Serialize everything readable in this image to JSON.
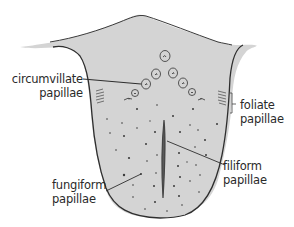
{
  "diagram": {
    "colors": {
      "tongue_fill": "#d4d4d4",
      "outline": "#2e2e2e",
      "dot": "#3a3a3a",
      "label_text": "#2a2a2a",
      "filiform_ridge": "#555555"
    },
    "labels": {
      "circumvillate": {
        "line1": "circumvillate",
        "line2": "papillae"
      },
      "foliate": {
        "line1": "foliate",
        "line2": "papillae"
      },
      "filiform": {
        "line1": "filiform",
        "line2": "papillae"
      },
      "fungiform": {
        "line1": "fungiform",
        "line2": "papillae"
      }
    }
  }
}
